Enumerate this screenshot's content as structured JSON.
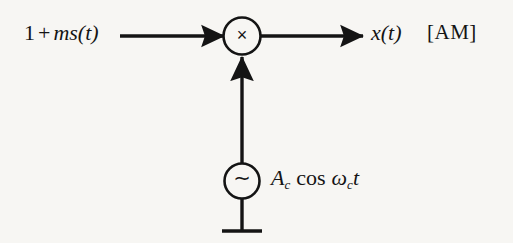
{
  "figure": {
    "background_color": "#f7f6f3",
    "ink_color": "#141414",
    "width": 513,
    "height": 243
  },
  "labels": {
    "input_signal": {
      "const": "1",
      "operator": "+",
      "modulation_index": "m",
      "message": "s(t)",
      "full_text": "1 + ms(t)"
    },
    "output_signal": {
      "text": "x(t)"
    },
    "modulation_tag": {
      "text": "[AM]"
    },
    "carrier_source": {
      "amplitude": "A",
      "amplitude_sub": "c",
      "function": "cos",
      "omega": "ω",
      "omega_sub": "c",
      "time": "t",
      "full_text": "A_c cos ω_c t"
    }
  },
  "blocks": {
    "multiplier": {
      "glyph": "×",
      "glyph_name": "multiply-symbol",
      "center_x": 242,
      "center_y": 36,
      "radius": 19
    },
    "oscillator": {
      "glyph": "∼",
      "glyph_name": "sine-source-symbol",
      "center_x": 242,
      "center_y": 181,
      "radius": 18
    },
    "ground": {
      "glyph_name": "ground-symbol",
      "stem_top_y": 199,
      "bar_y": 231,
      "bar_half_width": 20
    }
  },
  "connectors": {
    "input_arrow": {
      "name": "input-signal-arrow",
      "from_x": 120,
      "to_x": 223,
      "y": 36,
      "direction": "right"
    },
    "output_arrow": {
      "name": "output-signal-arrow",
      "from_x": 261,
      "to_x": 363,
      "y": 36,
      "direction": "right"
    },
    "carrier_arrow": {
      "name": "carrier-feed-arrow",
      "x": 242,
      "from_y": 163,
      "to_y": 56,
      "direction": "up"
    }
  }
}
